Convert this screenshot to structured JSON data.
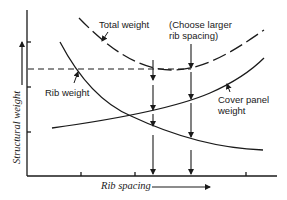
{
  "diagram": {
    "axes": {
      "y_label": "Structural weight",
      "x_label": "Rib spacing"
    },
    "labels": {
      "total_weight": "Total weight",
      "choose_line1": "(Choose larger",
      "choose_line2": "rib spacing)",
      "rib_weight": "Rib weight",
      "cover_line1": "Cover panel",
      "cover_line2": "weight"
    },
    "curves": [
      {
        "name": "Total weight",
        "style": "dashed"
      },
      {
        "name": "Rib weight",
        "style": "solid"
      },
      {
        "name": "Cover panel weight",
        "style": "solid"
      }
    ],
    "colors": {
      "ink": "#1a1a1a",
      "background": "#ffffff"
    }
  }
}
